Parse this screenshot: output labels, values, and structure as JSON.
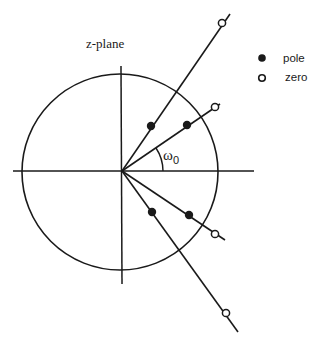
{
  "title": "z-plane",
  "legend": {
    "pole_label": "pole",
    "zero_label": "zero"
  },
  "angle_label": {
    "symbol": "ω",
    "subscript": "0"
  },
  "colors": {
    "stroke": "#1a1a1a",
    "background": "#ffffff"
  },
  "geometry": {
    "origin": [
      122,
      171
    ],
    "unit_circle_radius": 97,
    "poles": [
      [
        151,
        126
      ],
      [
        187,
        125
      ],
      [
        189,
        215
      ],
      [
        152,
        212
      ]
    ],
    "zeros": [
      [
        222,
        23
      ],
      [
        215,
        108
      ],
      [
        215,
        234
      ],
      [
        227,
        313
      ]
    ]
  }
}
